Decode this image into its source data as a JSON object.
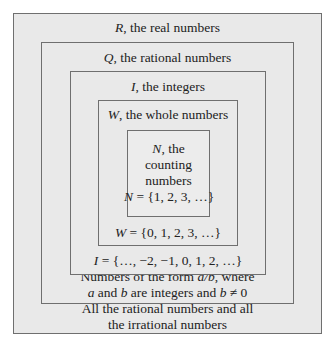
{
  "sets": {
    "R": {
      "symbol": "R",
      "title": ", the real numbers",
      "description_line1": "All the rational numbers and all",
      "description_line2": "the irrational numbers"
    },
    "Q": {
      "symbol": "Q",
      "title": ", the rational numbers",
      "description_line1_pre": "Numbers of the form ",
      "description_line1_frac": "a/b",
      "description_line1_post": ", where",
      "description_line2_a": "a",
      "description_line2_mid": " and ",
      "description_line2_b": "b",
      "description_line2_post": " are integers and ",
      "description_line2_b2": "b",
      "description_line2_end": " ≠ 0"
    },
    "I": {
      "symbol": "I",
      "title": ", the integers",
      "definition": " = {…, −2, −1, 0, 1, 2, …}"
    },
    "W": {
      "symbol": "W",
      "title": ", the whole numbers",
      "definition": " = {0, 1, 2, 3, …}"
    },
    "N": {
      "symbol": "N",
      "title_line1": ", the",
      "title_line2": "counting",
      "title_line3": "numbers",
      "definition": " = {1, 2, 3, …}"
    }
  }
}
